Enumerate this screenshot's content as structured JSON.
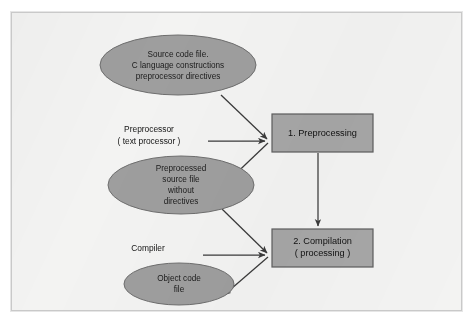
{
  "diagram": {
    "colors": {
      "page_background": "#ffffff",
      "frame_background": "#f3f3f2",
      "frame_border": "#c9c9c9",
      "ellipse_fill": "#9e9e9e",
      "ellipse_stroke": "#6e6e6e",
      "box_fill": "#a6a6a6",
      "box_stroke": "#5d5d5d",
      "arrow_color": "#3a3a3a",
      "text_color": "#1b1b1b"
    },
    "nodes": {
      "source_file": {
        "shape": "ellipse",
        "lines": [
          "Source code file.",
          "C language constructions",
          "preprocessor directives"
        ]
      },
      "preprocessed_file": {
        "shape": "ellipse",
        "lines": [
          "Preprocessed",
          "source file",
          "without",
          "directives"
        ]
      },
      "object_file": {
        "shape": "ellipse",
        "lines": [
          "Object code",
          "file"
        ]
      },
      "preprocessing_step": {
        "shape": "rectangle",
        "lines": [
          "1. Preprocessing"
        ]
      },
      "compilation_step": {
        "shape": "rectangle",
        "lines": [
          "2. Compilation",
          "( processing )"
        ]
      }
    },
    "edge_labels": {
      "preprocessor": {
        "lines": [
          "Preprocessor",
          "( text processor )"
        ]
      },
      "compiler": {
        "lines": [
          "Compiler"
        ]
      }
    },
    "arrows": [
      {
        "name": "source-to-preprocessing",
        "from": "source_file",
        "to": "preprocessing_step"
      },
      {
        "name": "preprocessor-label-to-preprocessing",
        "from": "preprocessor",
        "to": "preprocessing_step"
      },
      {
        "name": "preprocessing-to-preprocessed-file",
        "from": "preprocessing_step",
        "to": "preprocessed_file"
      },
      {
        "name": "preprocessing-to-compilation",
        "from": "preprocessing_step",
        "to": "compilation_step"
      },
      {
        "name": "preprocessed-file-to-compilation",
        "from": "preprocessed_file",
        "to": "compilation_step"
      },
      {
        "name": "compiler-label-to-compilation",
        "from": "compiler",
        "to": "compilation_step"
      },
      {
        "name": "compilation-to-object-file",
        "from": "compilation_step",
        "to": "object_file"
      }
    ]
  }
}
